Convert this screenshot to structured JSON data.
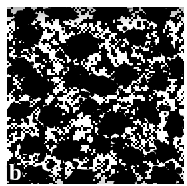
{
  "figure": {
    "panel_label": "b",
    "kind": "binary-thresholded-micrograph",
    "colors": {
      "page_background": "#ffffff",
      "foreground": "#ffffff",
      "background": "#000000",
      "label_text": "#ffffff"
    },
    "plate": {
      "x": 7,
      "y": 7,
      "width": 177,
      "height": 177,
      "margin": 7
    },
    "texture": {
      "type": "binary-speckle",
      "noise_cell_px": 2,
      "white_fraction": 0.46,
      "smoothing_passes": 1,
      "seed": 20240517
    },
    "blobs": [
      {
        "cx": 18,
        "cy": 10,
        "rx": 13,
        "ry": 8,
        "rot": -20
      },
      {
        "cx": 55,
        "cy": 6,
        "rx": 16,
        "ry": 7,
        "rot": 10
      },
      {
        "cx": 104,
        "cy": 5,
        "rx": 20,
        "ry": 8,
        "rot": -8
      },
      {
        "cx": 150,
        "cy": 8,
        "rx": 14,
        "ry": 9,
        "rot": 15
      },
      {
        "cx": 22,
        "cy": 28,
        "rx": 14,
        "ry": 11,
        "rot": 25
      },
      {
        "cx": 75,
        "cy": 40,
        "rx": 18,
        "ry": 12,
        "rot": -12
      },
      {
        "cx": 128,
        "cy": 30,
        "rx": 11,
        "ry": 9,
        "rot": 0
      },
      {
        "cx": 160,
        "cy": 42,
        "rx": 10,
        "ry": 8,
        "rot": 30
      },
      {
        "cx": 14,
        "cy": 60,
        "rx": 11,
        "ry": 10,
        "rot": 0
      },
      {
        "cx": 30,
        "cy": 80,
        "rx": 16,
        "ry": 13,
        "rot": -18
      },
      {
        "cx": 66,
        "cy": 72,
        "rx": 9,
        "ry": 8,
        "rot": 0
      },
      {
        "cx": 92,
        "cy": 78,
        "rx": 20,
        "ry": 10,
        "rot": 8
      },
      {
        "cx": 118,
        "cy": 68,
        "rx": 13,
        "ry": 10,
        "rot": -25
      },
      {
        "cx": 152,
        "cy": 76,
        "rx": 10,
        "ry": 9,
        "rot": 0
      },
      {
        "cx": 170,
        "cy": 62,
        "rx": 9,
        "ry": 11,
        "rot": 0
      },
      {
        "cx": 12,
        "cy": 104,
        "rx": 10,
        "ry": 9,
        "rot": 0
      },
      {
        "cx": 44,
        "cy": 110,
        "rx": 13,
        "ry": 11,
        "rot": 12
      },
      {
        "cx": 82,
        "cy": 100,
        "rx": 9,
        "ry": 8,
        "rot": 0
      },
      {
        "cx": 108,
        "cy": 116,
        "rx": 15,
        "ry": 12,
        "rot": -10
      },
      {
        "cx": 140,
        "cy": 104,
        "rx": 11,
        "ry": 9,
        "rot": 20
      },
      {
        "cx": 168,
        "cy": 118,
        "rx": 10,
        "ry": 12,
        "rot": 0
      },
      {
        "cx": 24,
        "cy": 138,
        "rx": 12,
        "ry": 10,
        "rot": 0
      },
      {
        "cx": 60,
        "cy": 144,
        "rx": 14,
        "ry": 11,
        "rot": -15
      },
      {
        "cx": 96,
        "cy": 138,
        "rx": 10,
        "ry": 9,
        "rot": 0
      },
      {
        "cx": 124,
        "cy": 150,
        "rx": 13,
        "ry": 10,
        "rot": 18
      },
      {
        "cx": 158,
        "cy": 146,
        "rx": 11,
        "ry": 10,
        "rot": 0
      },
      {
        "cx": 30,
        "cy": 168,
        "rx": 12,
        "ry": 9,
        "rot": 0
      },
      {
        "cx": 74,
        "cy": 170,
        "rx": 15,
        "ry": 8,
        "rot": -10
      },
      {
        "cx": 118,
        "cy": 172,
        "rx": 13,
        "ry": 9,
        "rot": 12
      },
      {
        "cx": 160,
        "cy": 170,
        "rx": 12,
        "ry": 9,
        "rot": 0
      }
    ]
  }
}
